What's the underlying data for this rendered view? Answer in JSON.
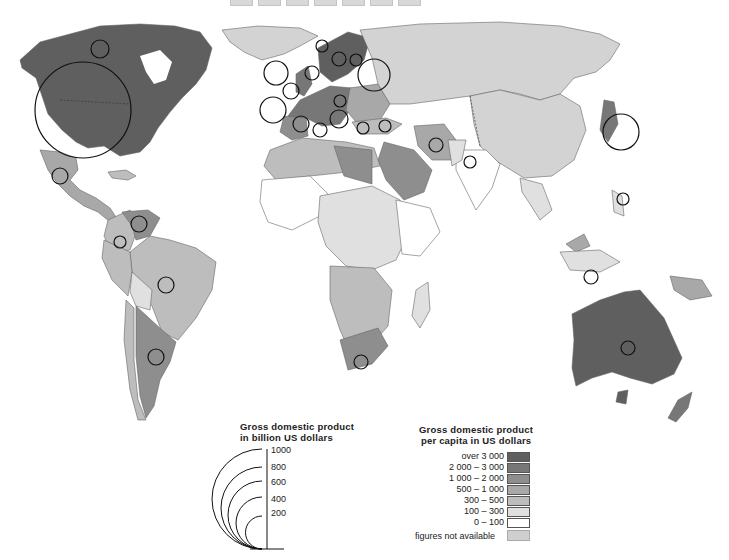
{
  "top_strip": {
    "cells": 7
  },
  "legend_gdp": {
    "title_line1": "Gross domestic product",
    "title_line2": "in billion US dollars",
    "scale": [
      "1000",
      "800",
      "600",
      "400",
      "200"
    ]
  },
  "legend_per_capita": {
    "title_line1": "Gross domestic product",
    "title_line2": "per capita in US dollars",
    "classes": [
      {
        "label": "over 3 000",
        "color": "#5f5f5f"
      },
      {
        "label": "2 000 – 3 000",
        "color": "#777777"
      },
      {
        "label": "1 000 – 2 000",
        "color": "#8e8e8e"
      },
      {
        "label": "500 – 1 000",
        "color": "#a8a8a8"
      },
      {
        "label": "300 – 500",
        "color": "#bdbdbd"
      },
      {
        "label": "100 – 300",
        "color": "#e0e0e0"
      },
      {
        "label": "0 – 100",
        "color": "#ffffff"
      }
    ],
    "not_available_label": "figures not available",
    "not_available_color": "#cfcfcf"
  },
  "colors": {
    "land_ussr_china": "#d3d3d3",
    "north_america": "#5f5f5f",
    "ocean": "#ffffff",
    "circle_stroke": "#111111"
  },
  "map": {
    "regions": [
      {
        "name": "North America (USA, Canada)",
        "class": "over 3 000"
      },
      {
        "name": "Greenland",
        "class": "figures not available"
      },
      {
        "name": "Mexico",
        "class": "500 – 1 000"
      },
      {
        "name": "Venezuela",
        "class": "1 000 – 2 000"
      },
      {
        "name": "Brazil",
        "class": "300 – 500"
      },
      {
        "name": "Argentina",
        "class": "1 000 – 2 000"
      },
      {
        "name": "Bolivia",
        "class": "100 – 300"
      },
      {
        "name": "Western Europe",
        "class": "2 000 – 3 000"
      },
      {
        "name": "Scandinavia",
        "class": "over 3 000"
      },
      {
        "name": "USSR",
        "class": "figures not available"
      },
      {
        "name": "China",
        "class": "figures not available"
      },
      {
        "name": "Japan",
        "class": "2 000 – 3 000"
      },
      {
        "name": "Libya",
        "class": "1 000 – 2 000"
      },
      {
        "name": "Saudi Arabia",
        "class": "1 000 – 2 000"
      },
      {
        "name": "Iran",
        "class": "500 – 1 000"
      },
      {
        "name": "India",
        "class": "0 – 100"
      },
      {
        "name": "South Africa",
        "class": "1 000 – 2 000"
      },
      {
        "name": "Australia",
        "class": "over 3 000"
      },
      {
        "name": "New Zealand",
        "class": "2 000 – 3 000"
      }
    ]
  }
}
